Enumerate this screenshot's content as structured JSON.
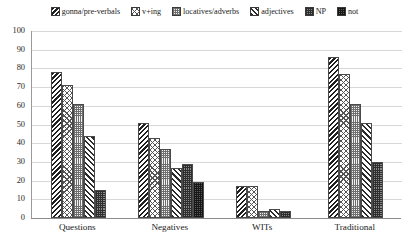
{
  "chart_data": {
    "type": "bar",
    "title": "",
    "xlabel": "",
    "ylabel": "",
    "ylim": [
      0,
      100
    ],
    "ytick_step": 10,
    "yticks": [
      100,
      90,
      80,
      70,
      60,
      50,
      40,
      30,
      20,
      10,
      0
    ],
    "grid": true,
    "grid_axis": "y",
    "legend_position": "top",
    "categories": [
      "Questions",
      "Negatives",
      "WITs",
      "Traditional"
    ],
    "series": [
      {
        "name": "gonna/pre-verbals",
        "pattern": "dense-back-diagonal",
        "values": [
          78,
          51,
          17,
          86
        ]
      },
      {
        "name": "v+ing",
        "pattern": "light-lattice",
        "values": [
          71,
          43,
          17,
          77
        ]
      },
      {
        "name": "locatives/adverbs",
        "pattern": "fine-grey-stipple",
        "values": [
          61,
          37,
          4,
          61
        ]
      },
      {
        "name": "adjectives",
        "pattern": "forward-diagonal",
        "values": [
          44,
          27,
          5,
          51
        ]
      },
      {
        "name": "NP",
        "pattern": "dark-stipple",
        "values": [
          15,
          29,
          4,
          30
        ]
      },
      {
        "name": "not",
        "pattern": "darkest-check",
        "values": [
          null,
          19,
          null,
          null
        ]
      }
    ]
  },
  "legend": {
    "items": [
      {
        "label": "gonna/pre-verbals"
      },
      {
        "label": "v+ing"
      },
      {
        "label": "locatives/adverbs"
      },
      {
        "label": "adjectives"
      },
      {
        "label": "NP"
      },
      {
        "label": "not"
      }
    ]
  },
  "axes": {
    "y": {
      "ticks": [
        "100",
        "90",
        "80",
        "70",
        "60",
        "50",
        "40",
        "30",
        "20",
        "10",
        "0"
      ]
    },
    "x": {
      "labels": [
        "Questions",
        "Negatives",
        "WITs",
        "Traditional"
      ]
    }
  },
  "colors": {
    "background": "#ffffff",
    "grid": "#d8d8d8",
    "axis": "#8c8c8c",
    "bar_outline": "#4a4a4a",
    "text": "#1a1a1a"
  }
}
